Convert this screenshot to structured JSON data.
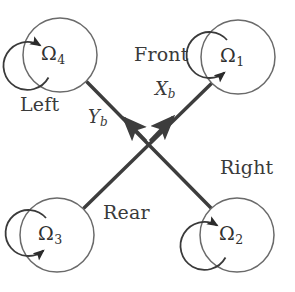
{
  "figure": {
    "stroke_color": "#4a4a4a",
    "text_color": "#3a3a3a",
    "background": "#ffffff",
    "width": 295,
    "height": 292
  },
  "rotors": [
    {
      "id": "rotor-1",
      "label": "Ω",
      "subscript": "1",
      "position": "front-right",
      "cx": 238,
      "cy": 57,
      "outer_r": 37,
      "inner_r": 23,
      "spin": "clockwise",
      "arrow_angle_deg": 210
    },
    {
      "id": "rotor-2",
      "label": "Ω",
      "subscript": "2",
      "position": "rear-right",
      "cx": 237,
      "cy": 235,
      "outer_r": 37,
      "inner_r": 23,
      "spin": "counter-clockwise",
      "arrow_angle_deg": 172
    },
    {
      "id": "rotor-3",
      "label": "Ω",
      "subscript": "3",
      "position": "rear-left",
      "cx": 57,
      "cy": 235,
      "outer_r": 37,
      "inner_r": 23,
      "spin": "clockwise",
      "arrow_angle_deg": 205
    },
    {
      "id": "rotor-4",
      "label": "Ω",
      "subscript": "4",
      "position": "front-left",
      "cx": 60,
      "cy": 55,
      "outer_r": 37,
      "inner_r": 23,
      "spin": "counter-clockwise",
      "arrow_angle_deg": 172
    }
  ],
  "arms": [
    {
      "id": "arm-front-right",
      "x1": 148,
      "y1": 143,
      "x2": 213,
      "y2": 82
    },
    {
      "id": "arm-rear-left",
      "x1": 148,
      "y1": 143,
      "x2": 84,
      "y2": 208
    },
    {
      "id": "arm-front-left",
      "x1": 148,
      "y1": 143,
      "x2": 87,
      "y2": 82
    },
    {
      "id": "arm-rear-right",
      "x1": 148,
      "y1": 143,
      "x2": 211,
      "y2": 208
    }
  ],
  "axes": [
    {
      "id": "axis-xb",
      "label": "X",
      "subscript": "b",
      "tip_x": 175,
      "tip_y": 114,
      "angle_deg": -45,
      "label_x": 155,
      "label_y": 80
    },
    {
      "id": "axis-yb",
      "label": "Y",
      "subscript": "b",
      "tip_x": 122,
      "tip_y": 114,
      "angle_deg": -135,
      "label_x": 88,
      "label_y": 108
    }
  ],
  "direction_labels": [
    {
      "id": "label-front",
      "text": "Front",
      "x": 134,
      "y": 45
    },
    {
      "id": "label-left",
      "text": "Left",
      "x": 20,
      "y": 95
    },
    {
      "id": "label-right",
      "text": "Right",
      "x": 220,
      "y": 158
    },
    {
      "id": "label-rear",
      "text": "Rear",
      "x": 103,
      "y": 203
    }
  ]
}
